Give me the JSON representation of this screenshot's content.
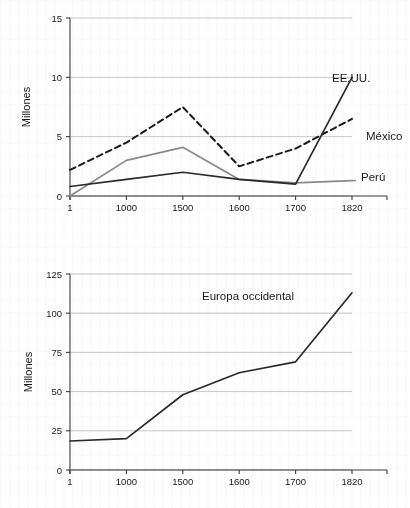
{
  "page": {
    "background_color": "#ffffff",
    "text_color": "#1a1a1a"
  },
  "chart_data": [
    {
      "id": "top",
      "type": "line",
      "title": "",
      "xlabel": "",
      "ylabel": "Millones",
      "x": [
        "1",
        "1000",
        "1500",
        "1600",
        "1700",
        "1820"
      ],
      "xtick_labels": [
        "1",
        "1000",
        "1500",
        "1600",
        "1700",
        "1820"
      ],
      "ytick_labels": [
        "0",
        "5",
        "10",
        "15"
      ],
      "yticks": [
        0,
        5,
        10,
        15
      ],
      "ylim": [
        0,
        15
      ],
      "grid": true,
      "legend_position": "right-inline-labels",
      "series": [
        {
          "name": "México",
          "label": "México",
          "color": "#1a1a1a",
          "style": "dashed",
          "values": [
            2.2,
            4.5,
            7.5,
            2.5,
            4.0,
            6.5
          ],
          "label_x": 1820,
          "label_y": 6.5
        },
        {
          "name": "Perú",
          "label": "Perú",
          "color": "#8a8a8a",
          "style": "solid",
          "values": [
            0.0,
            3.0,
            4.1,
            1.4,
            1.1,
            1.3
          ],
          "label_x": 1820,
          "label_y": 1.3
        },
        {
          "name": "EE.UU.",
          "label": "EE.UU.",
          "color": "#2a2a2a",
          "style": "solid",
          "values": [
            0.8,
            1.4,
            2.0,
            1.4,
            1.0,
            10.0
          ],
          "label_x": 1820,
          "label_y": 10.0
        }
      ]
    },
    {
      "id": "bottom",
      "type": "line",
      "title": "",
      "xlabel": "",
      "ylabel": "Millones",
      "x": [
        "1",
        "1000",
        "1500",
        "1600",
        "1700",
        "1820"
      ],
      "xtick_labels": [
        "1",
        "1000",
        "1500",
        "1600",
        "1700",
        "1820"
      ],
      "ytick_labels": [
        "0",
        "25",
        "50",
        "75",
        "100",
        "125"
      ],
      "yticks": [
        0,
        25,
        50,
        75,
        100,
        125
      ],
      "ylim": [
        0,
        125
      ],
      "grid": true,
      "legend_position": "inline-annotation",
      "series": [
        {
          "name": "Europa occidental",
          "label": "Europa occidental",
          "color": "#2a2a2a",
          "style": "solid",
          "values": [
            18.5,
            20.0,
            48.0,
            62.0,
            69.0,
            113.0
          ],
          "label_x": 1650,
          "label_y": 115
        }
      ]
    }
  ],
  "annotations": {
    "top_chart_name": "top-line-chart",
    "bottom_chart_name": "bottom-line-chart"
  }
}
